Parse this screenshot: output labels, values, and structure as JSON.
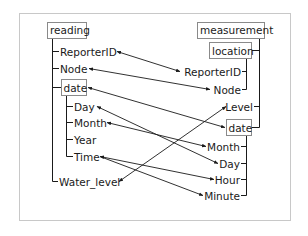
{
  "diagram": {
    "type": "schema-mapping",
    "frame_color": "#c8c8c8",
    "line_color": "#1a1a1a",
    "left_schema": {
      "root": "reading",
      "children": [
        {
          "label": "ReporterID"
        },
        {
          "label": "Node"
        },
        {
          "label": "date",
          "children": [
            {
              "label": "Day"
            },
            {
              "label": "Month"
            },
            {
              "label": "Year"
            },
            {
              "label": "Time"
            }
          ]
        },
        {
          "label": "Water_level"
        }
      ]
    },
    "right_schema": {
      "root": "measurement",
      "children": [
        {
          "label": "location",
          "children": [
            {
              "label": "ReporterID"
            },
            {
              "label": "Node"
            }
          ]
        },
        {
          "label": "Level"
        },
        {
          "label": "date",
          "children": [
            {
              "label": "Month"
            },
            {
              "label": "Day"
            },
            {
              "label": "Hour"
            },
            {
              "label": "Minute"
            }
          ]
        }
      ]
    },
    "mappings": [
      {
        "from": "reading/ReporterID",
        "to": "measurement/location/ReporterID",
        "bidirectional": true
      },
      {
        "from": "reading/Node",
        "to": "measurement/location/Node",
        "bidirectional": true
      },
      {
        "from": "reading/date",
        "to": "measurement/date",
        "bidirectional": true
      },
      {
        "from": "reading/date/Day",
        "to": "measurement/date/Day",
        "bidirectional": true
      },
      {
        "from": "reading/date/Month",
        "to": "measurement/date/Month",
        "bidirectional": true
      },
      {
        "from": "reading/date/Time",
        "to": "measurement/date/Hour",
        "bidirectional": true
      },
      {
        "from": "reading/date/Time",
        "to": "measurement/date/Minute",
        "bidirectional": true
      },
      {
        "from": "reading/Water_level",
        "to": "measurement/Level",
        "bidirectional": true
      }
    ]
  },
  "labels": {
    "left_root": "reading",
    "left_reporterid": "ReporterID",
    "left_node": "Node",
    "left_date": "date",
    "left_day": "Day",
    "left_month": "Month",
    "left_year": "Year",
    "left_time": "Time",
    "left_water_level": "Water_level",
    "right_root": "measurement",
    "right_location": "location",
    "right_reporterid": "ReporterID",
    "right_node": "Node",
    "right_level": "Level",
    "right_date": "date",
    "right_month": "Month",
    "right_day": "Day",
    "right_hour": "Hour",
    "right_minute": "Minute"
  }
}
